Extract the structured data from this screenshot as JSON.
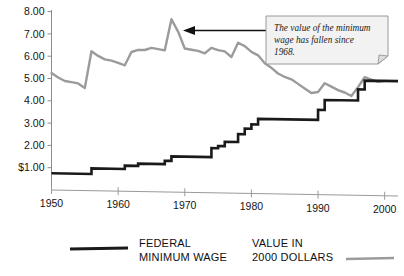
{
  "chart_data": {
    "type": "line",
    "title": "",
    "subtitle": "",
    "xlabel": "",
    "ylabel": "",
    "xlim": [
      1950,
      2002
    ],
    "ylim": [
      0,
      8.0
    ],
    "grid": false,
    "legend_position": "bottom",
    "x_ticks": [
      1950,
      1960,
      1970,
      1980,
      1990,
      2000
    ],
    "x_tick_labels": [
      "1950",
      "1960",
      "1970",
      "1980",
      "1990",
      "2000"
    ],
    "y_ticks": [
      1.0,
      2.0,
      3.0,
      4.0,
      5.0,
      6.0,
      7.0,
      8.0
    ],
    "y_tick_labels": [
      "$1.00",
      "2.00",
      "3.00",
      "4.00",
      "5.00",
      "6.00",
      "7.00",
      "8.00"
    ],
    "series": [
      {
        "name": "FEDERAL MINIMUM WAGE",
        "color": "#1a1a1a",
        "style": "step",
        "x": [
          1950,
          1956,
          1956,
          1961,
          1961,
          1963,
          1963,
          1967,
          1967,
          1968,
          1968,
          1974,
          1974,
          1975,
          1975,
          1976,
          1976,
          1978,
          1978,
          1979,
          1979,
          1980,
          1980,
          1981,
          1981,
          1990,
          1990,
          1991,
          1991,
          1996,
          1996,
          1997,
          1997,
          2002
        ],
        "y": [
          0.75,
          0.75,
          1.0,
          1.0,
          1.15,
          1.15,
          1.25,
          1.25,
          1.4,
          1.4,
          1.6,
          1.6,
          2.0,
          2.0,
          2.1,
          2.1,
          2.3,
          2.3,
          2.65,
          2.65,
          2.9,
          2.9,
          3.1,
          3.1,
          3.35,
          3.35,
          3.8,
          3.8,
          4.25,
          4.25,
          4.75,
          4.75,
          5.15,
          5.15
        ],
        "annual_values": [
          {
            "year": 1950,
            "value": 0.75
          },
          {
            "year": 1956,
            "value": 1.0
          },
          {
            "year": 1961,
            "value": 1.15
          },
          {
            "year": 1963,
            "value": 1.25
          },
          {
            "year": 1967,
            "value": 1.4
          },
          {
            "year": 1968,
            "value": 1.6
          },
          {
            "year": 1974,
            "value": 2.0
          },
          {
            "year": 1975,
            "value": 2.1
          },
          {
            "year": 1976,
            "value": 2.3
          },
          {
            "year": 1978,
            "value": 2.65
          },
          {
            "year": 1979,
            "value": 2.9
          },
          {
            "year": 1980,
            "value": 3.1
          },
          {
            "year": 1981,
            "value": 3.35
          },
          {
            "year": 1990,
            "value": 3.8
          },
          {
            "year": 1991,
            "value": 4.25
          },
          {
            "year": 1996,
            "value": 4.75
          },
          {
            "year": 1997,
            "value": 5.15
          }
        ]
      },
      {
        "name": "VALUE IN 2000 DOLLARS",
        "color": "#9b9b9b",
        "style": "line",
        "x": [
          1950,
          1951,
          1952,
          1953,
          1954,
          1955,
          1956,
          1957,
          1958,
          1959,
          1960,
          1961,
          1962,
          1963,
          1964,
          1965,
          1966,
          1967,
          1968,
          1969,
          1970,
          1971,
          1972,
          1973,
          1974,
          1975,
          1976,
          1977,
          1978,
          1979,
          1980,
          1981,
          1982,
          1983,
          1984,
          1985,
          1986,
          1987,
          1988,
          1989,
          1990,
          1991,
          1992,
          1993,
          1994,
          1995,
          1996,
          1997,
          1998,
          1999,
          2000
        ],
        "y": [
          5.25,
          5.05,
          4.9,
          4.85,
          4.8,
          4.6,
          6.25,
          6.05,
          5.9,
          5.85,
          5.75,
          5.65,
          6.25,
          6.35,
          6.35,
          6.45,
          6.4,
          6.35,
          7.75,
          7.2,
          6.45,
          6.4,
          6.35,
          6.25,
          6.5,
          6.4,
          6.35,
          6.1,
          6.75,
          6.6,
          6.35,
          6.2,
          5.85,
          5.65,
          5.4,
          5.25,
          5.15,
          4.95,
          4.75,
          4.55,
          4.6,
          5.0,
          4.85,
          4.7,
          4.6,
          4.45,
          4.85,
          5.3,
          5.2,
          5.1,
          5.15
        ]
      }
    ],
    "annotations": [
      {
        "name": "callout",
        "text": "The value of the minimum wage has fallen since 1968.",
        "lines": [
          "The value of the minimum",
          "wage has fallen since",
          "1968."
        ],
        "points_to_year": 1968,
        "points_to_value": 7.55
      }
    ]
  },
  "legend": {
    "entries": [
      {
        "label_line1": "FEDERAL",
        "label_line2": "MINIMUM WAGE",
        "swatch_color": "#1a1a1a",
        "swatch_position": "left"
      },
      {
        "label_line1": "VALUE IN",
        "label_line2": "2000 DOLLARS",
        "swatch_color": "#9b9b9b",
        "swatch_position": "right"
      }
    ]
  },
  "colors": {
    "federal_line": "#1a1a1a",
    "real_value_line": "#9b9b9b",
    "axis": "#8c8c8c",
    "text": "#141414",
    "callout_fill": "#f2f2f2",
    "callout_border": "#8f8f8f",
    "background": "#ffffff"
  }
}
